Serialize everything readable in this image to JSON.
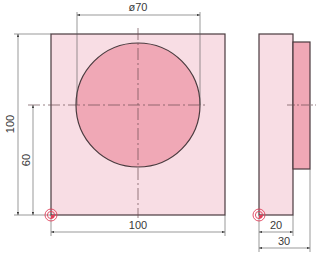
{
  "drawing": {
    "colors": {
      "plate_fill": "#f8dde4",
      "boss_fill": "#f0a8b6",
      "outline": "#4a3a3e",
      "dim_line": "#555555",
      "center_line": "#6a4a52",
      "datum_symbol": "#e0405a"
    },
    "front_view": {
      "plate": {
        "x": 51,
        "y": 34,
        "w": 174,
        "h": 181
      },
      "circle": {
        "cx": 138,
        "cy": 105,
        "r": 62
      },
      "labels": {
        "diameter": "ø70",
        "width": "100",
        "height": "100",
        "center_height": "60"
      }
    },
    "side_view": {
      "plate": {
        "x": 259,
        "y": 34,
        "w": 34,
        "h": 181
      },
      "boss": {
        "x": 293,
        "y": 42,
        "w": 17,
        "h": 127
      },
      "labels": {
        "plate_thickness": "20",
        "total_thickness": "30"
      }
    },
    "datum_icons": [
      "datum-origin-front",
      "datum-origin-side"
    ]
  }
}
